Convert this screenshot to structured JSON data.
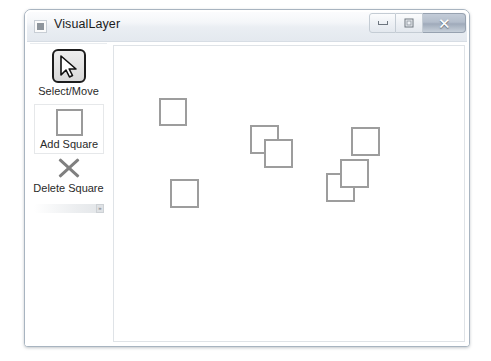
{
  "window": {
    "title": "VisualLayer",
    "icon": "app-square-icon",
    "controls": {
      "minimize": {
        "name": "minimize-button",
        "glyph": "—"
      },
      "maximize": {
        "name": "maximize-button",
        "glyph": "□"
      },
      "close": {
        "name": "close-button",
        "glyph": "✕"
      }
    }
  },
  "toolbar": {
    "overflow_chevron": "»",
    "tools": [
      {
        "id": "select-move",
        "label": "Select/Move",
        "icon": "cursor-arrow-icon",
        "state": "active"
      },
      {
        "id": "add-square",
        "label": "Add Square",
        "icon": "square-outline-icon",
        "state": "normal"
      },
      {
        "id": "delete-square",
        "label": "Delete Square",
        "icon": "x-cross-icon",
        "state": "normal"
      }
    ]
  },
  "canvas": {
    "name": "drawing-canvas",
    "background": "#ffffff",
    "border_color": "#dfe3e7",
    "shape_stroke": "#9d9d9d",
    "shape_fill": "#ffffff",
    "shape_stroke_width": 2,
    "shapes": [
      {
        "id": "square-1",
        "x": 45,
        "y": 52,
        "w": 28,
        "h": 28
      },
      {
        "id": "square-2",
        "x": 136,
        "y": 79,
        "w": 29,
        "h": 29
      },
      {
        "id": "square-3",
        "x": 150,
        "y": 93,
        "w": 29,
        "h": 29
      },
      {
        "id": "square-4",
        "x": 237,
        "y": 81,
        "w": 29,
        "h": 29
      },
      {
        "id": "square-5",
        "x": 212,
        "y": 127,
        "w": 29,
        "h": 29
      },
      {
        "id": "square-6",
        "x": 226,
        "y": 113,
        "w": 29,
        "h": 29
      },
      {
        "id": "square-7",
        "x": 56,
        "y": 133,
        "w": 29,
        "h": 29
      }
    ]
  }
}
